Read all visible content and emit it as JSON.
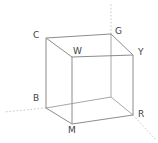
{
  "figure": {
    "width": 158,
    "height": 143,
    "background_color": "#ffffff"
  },
  "style": {
    "edge_color": "#8c8c8c",
    "hidden_edge_color": "#a8a8a8",
    "axis_ray_color": "#c9c9c9",
    "label_color": "#3f3f3f",
    "edge_width": 1,
    "label_font_size_px": 9
  },
  "vertices": [
    {
      "id": "C",
      "label": "C",
      "name": "cyan",
      "x": 46,
      "y": 38,
      "label_x": 33,
      "label_y": 31,
      "hidden": false
    },
    {
      "id": "G",
      "label": "G",
      "name": "green",
      "x": 111,
      "y": 34,
      "label_x": 115,
      "label_y": 27,
      "hidden": false
    },
    {
      "id": "W",
      "label": "W",
      "name": "white",
      "x": 72,
      "y": 57,
      "label_x": 73,
      "label_y": 47,
      "hidden": false
    },
    {
      "id": "Y",
      "label": "Y",
      "name": "yellow",
      "x": 133,
      "y": 55,
      "label_x": 138,
      "label_y": 48,
      "hidden": false
    },
    {
      "id": "B",
      "label": "B",
      "name": "blue",
      "x": 46,
      "y": 108,
      "label_x": 33,
      "label_y": 94,
      "hidden": false
    },
    {
      "id": "M",
      "label": "M",
      "name": "magenta",
      "x": 72,
      "y": 124,
      "label_x": 68,
      "label_y": 126,
      "hidden": false
    },
    {
      "id": "R",
      "label": "R",
      "name": "red",
      "x": 133,
      "y": 115,
      "label_x": 138,
      "label_y": 110,
      "hidden": false
    },
    {
      "id": "K",
      "label": "",
      "name": "black",
      "x": 111,
      "y": 97,
      "label_x": 111,
      "label_y": 97,
      "hidden": true
    }
  ],
  "edges": [
    {
      "from": "C",
      "to": "G",
      "kind": "solid"
    },
    {
      "from": "C",
      "to": "W",
      "kind": "solid"
    },
    {
      "from": "C",
      "to": "B",
      "kind": "solid"
    },
    {
      "from": "G",
      "to": "Y",
      "kind": "solid"
    },
    {
      "from": "W",
      "to": "Y",
      "kind": "solid"
    },
    {
      "from": "W",
      "to": "M",
      "kind": "solid"
    },
    {
      "from": "Y",
      "to": "R",
      "kind": "solid"
    },
    {
      "from": "B",
      "to": "M",
      "kind": "solid"
    },
    {
      "from": "M",
      "to": "R",
      "kind": "solid"
    },
    {
      "from": "G",
      "to": "K",
      "kind": "hidden"
    },
    {
      "from": "B",
      "to": "K",
      "kind": "hidden"
    },
    {
      "from": "R",
      "to": "K",
      "kind": "hidden"
    }
  ],
  "axis_rays": [
    {
      "id": "axis-green",
      "from": "G",
      "to_x": 111,
      "to_y": 4,
      "kind": "dotted"
    },
    {
      "id": "axis-blue",
      "from": "B",
      "to_x": 4,
      "to_y": 112,
      "kind": "dotted"
    },
    {
      "id": "axis-red",
      "from": "R",
      "to_x": 156,
      "to_y": 140,
      "kind": "dotted"
    }
  ]
}
